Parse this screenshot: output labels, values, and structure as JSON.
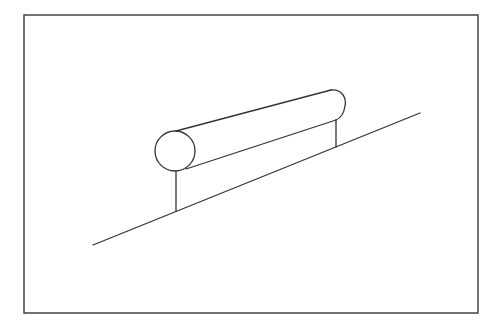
{
  "diagram": {
    "colors": {
      "background": "#ffffff",
      "line": "#333333",
      "frame": "#444444"
    },
    "frame": {
      "x": 24,
      "y": 15,
      "width": 454,
      "height": 298
    },
    "slope_line": {
      "x1": 93,
      "y1": 245,
      "x2": 420,
      "y2": 113
    },
    "pipe": {
      "end_circle": {
        "cx": 175,
        "cy": 151,
        "r": 20
      },
      "top_edge": {
        "x1": 176,
        "y1": 131,
        "x2": 331,
        "y2": 90
      },
      "bottom_edge": {
        "x1": 186,
        "y1": 169,
        "x2": 336,
        "y2": 120
      },
      "far_end_arc": {
        "x1": 331,
        "y1": 90,
        "x2": 336,
        "y2": 120
      }
    },
    "supports": [
      {
        "name": "left-post",
        "x": 176,
        "y1": 171,
        "y2": 211
      },
      {
        "name": "right-post",
        "x": 336,
        "y1": 120,
        "y2": 147
      }
    ]
  }
}
